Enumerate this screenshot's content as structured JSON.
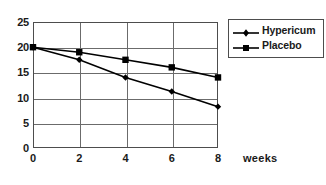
{
  "chart_data": {
    "type": "line",
    "title": "",
    "xlabel": "weeks",
    "ylabel": "",
    "x": [
      0,
      2,
      4,
      6,
      8
    ],
    "xticklabels": [
      "0",
      "2",
      "4",
      "6",
      "8"
    ],
    "yticks": [
      0,
      5,
      10,
      15,
      20,
      25
    ],
    "yticklabels": [
      "0",
      "5",
      "10",
      "15",
      "20",
      "25"
    ],
    "xlim": [
      0,
      8
    ],
    "ylim": [
      0,
      25
    ],
    "grid": true,
    "legend_position": "top-right",
    "series": [
      {
        "name": "Hypericum",
        "marker": "diamond",
        "color": "#000000",
        "values": [
          20,
          17.5,
          14,
          11.2,
          8.2
        ]
      },
      {
        "name": "Placebo",
        "marker": "square",
        "color": "#000000",
        "values": [
          20,
          19,
          17.5,
          16,
          14
        ]
      }
    ]
  },
  "legend": {
    "entries": [
      {
        "label": "Hypericum",
        "marker": "diamond-marker-icon"
      },
      {
        "label": "Placebo",
        "marker": "square-marker-icon"
      }
    ]
  },
  "axes": {
    "x_title": "weeks",
    "x_ticks": [
      "0",
      "2",
      "4",
      "6",
      "8"
    ],
    "y_ticks": [
      "0",
      "5",
      "10",
      "15",
      "20",
      "25"
    ]
  },
  "colors": {
    "line": "#000000",
    "frame": "#4d4d4d",
    "grid": "#6b6b6b",
    "text": "#1a1a1a",
    "background": "#ffffff"
  }
}
